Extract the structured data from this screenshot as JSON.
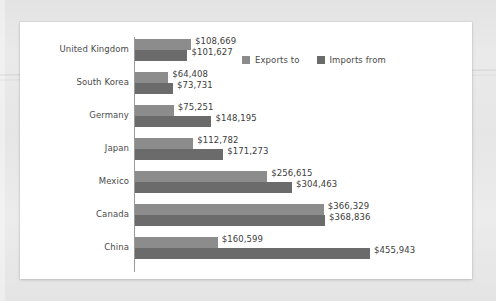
{
  "chart_data": {
    "type": "bar",
    "orientation": "horizontal",
    "title": "",
    "xlabel": "",
    "ylabel": "",
    "grid": false,
    "legend_position": "top-right",
    "axis_min": 0,
    "axis_max": 455943,
    "value_prefix": "$",
    "categories": [
      "United Kingdom",
      "South Korea",
      "Germany",
      "Japan",
      "Mexico",
      "Canada",
      "China"
    ],
    "series": [
      {
        "name": "Exports to",
        "color": "#8c8c8c",
        "values": [
          108669,
          64408,
          75251,
          112782,
          256615,
          366329,
          160599
        ],
        "labels": [
          "$108,669",
          "$64,408",
          "$75,251",
          "$112,782",
          "$256,615",
          "$366,329",
          "$160,599"
        ]
      },
      {
        "name": "Imports from",
        "color": "#6b6b6b",
        "values": [
          101627,
          73731,
          148195,
          171273,
          304463,
          368836,
          455943
        ],
        "labels": [
          "$101,627",
          "$73,731",
          "$148,195",
          "$171,273",
          "$304,463",
          "$368,836",
          "$455,943"
        ]
      }
    ]
  },
  "legend": {
    "items": [
      {
        "label": "Exports to",
        "swatch": "exports-swatch-icon"
      },
      {
        "label": "Imports from",
        "swatch": "imports-swatch-icon"
      }
    ]
  },
  "colors": {
    "exports": "#8c8c8c",
    "imports": "#6b6b6b",
    "axis": "#9a9a9a",
    "text": "#4a4a4a",
    "card_background": "#ffffff",
    "page_background": "#e8e8e8"
  }
}
